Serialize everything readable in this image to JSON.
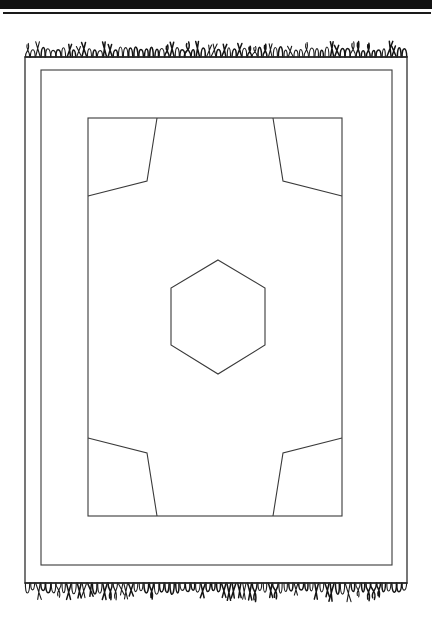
{
  "document": {
    "title": "Rug pattern line drawing",
    "page_background": "#ffffff",
    "ink_color": "#3a3a3a",
    "fringe_color": "#141414"
  },
  "header_rule": {
    "name": "page-top-rule",
    "thick_bar_height_px": 9,
    "thin_bar_height_px": 2,
    "color": "#121212"
  },
  "chart_data": {
    "type": "diagram",
    "xlabel": "",
    "ylabel": "",
    "canvas": {
      "width": 432,
      "height": 609
    },
    "elements": [
      {
        "name": "outer-border-rect",
        "kind": "rect",
        "x": 25,
        "y": 35,
        "width": 382,
        "height": 526,
        "stroke": "#2e2e2e"
      },
      {
        "name": "middle-border-rect",
        "kind": "rect",
        "x": 41,
        "y": 48,
        "width": 351,
        "height": 495,
        "stroke": "#3a3a3a"
      },
      {
        "name": "inner-field-rect",
        "kind": "rect",
        "x": 88,
        "y": 96,
        "width": 254,
        "height": 398,
        "stroke": "#3a3a3a"
      },
      {
        "name": "center-hexagon-medallion",
        "kind": "polygon",
        "points": "218,238 265,266 265,323 218,352 171,323 171,266",
        "stroke": "#3a3a3a"
      },
      {
        "name": "corner-motif-top-left",
        "kind": "polyline",
        "points": "157,96 147,159 88,174",
        "stroke": "#3a3a3a"
      },
      {
        "name": "corner-motif-top-right",
        "kind": "polyline",
        "points": "273,96 283,159 342,174",
        "stroke": "#3a3a3a"
      },
      {
        "name": "corner-motif-bottom-left",
        "kind": "polyline",
        "points": "157,494 147,431 88,416",
        "stroke": "#3a3a3a"
      },
      {
        "name": "corner-motif-bottom-right",
        "kind": "polyline",
        "points": "273,494 283,431 342,416",
        "stroke": "#3a3a3a"
      },
      {
        "name": "fringe-top",
        "kind": "fringe",
        "edge": "top",
        "baseline_y": 35,
        "length_px": 16,
        "strand_count": 74
      },
      {
        "name": "fringe-bottom",
        "kind": "fringe",
        "edge": "bottom",
        "baseline_y": 561,
        "length_px": 18,
        "strand_count": 74
      }
    ]
  }
}
